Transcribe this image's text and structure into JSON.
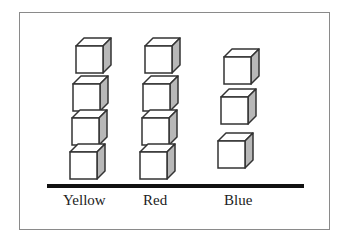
{
  "diagram": {
    "type": "pictograph",
    "categories": [
      {
        "label": "Yellow",
        "count": 4
      },
      {
        "label": "Red",
        "count": 4
      },
      {
        "label": "Blue",
        "count": 3
      }
    ],
    "colors": {
      "frame": "#8a8a8a",
      "cube_outline": "#333333",
      "cube_front": "#ffffff",
      "cube_top": "#ffffff",
      "cube_side": "#b8b8b8",
      "baseline": "#111111"
    }
  },
  "chart_data": {
    "type": "bar",
    "categories": [
      "Yellow",
      "Red",
      "Blue"
    ],
    "values": [
      4,
      4,
      3
    ],
    "title": "",
    "xlabel": "",
    "ylabel": ""
  }
}
